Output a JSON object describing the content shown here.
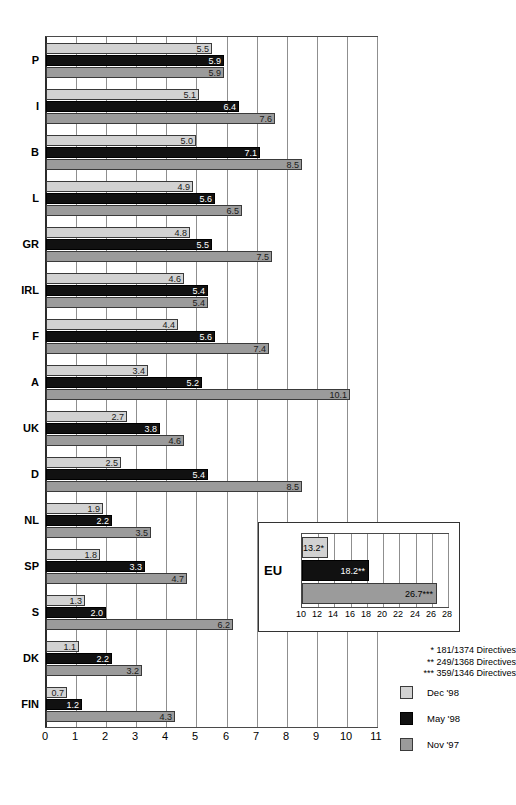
{
  "chart_data": {
    "type": "bar",
    "orientation": "horizontal",
    "title": "",
    "xlabel": "",
    "ylabel": "",
    "xlim": [
      0,
      11
    ],
    "xticks": [
      "0",
      "1",
      "2",
      "3",
      "4",
      "5",
      "6",
      "7",
      "8",
      "9",
      "10",
      "11"
    ],
    "grid": true,
    "legend_position": "bottom-right",
    "categories": [
      "P",
      "I",
      "B",
      "L",
      "GR",
      "IRL",
      "F",
      "A",
      "UK",
      "D",
      "NL",
      "SP",
      "S",
      "DK",
      "FIN"
    ],
    "series": [
      {
        "name": "Dec '98",
        "color": "#d2d2d2",
        "values": [
          5.5,
          5.1,
          5.0,
          4.9,
          4.8,
          4.6,
          4.4,
          3.4,
          2.7,
          2.5,
          1.9,
          1.8,
          1.3,
          1.1,
          0.7
        ],
        "labels": [
          "5.5",
          "5.1",
          "5.0",
          "4.9",
          "4.8",
          "4.6",
          "4.4",
          "3.4",
          "2.7",
          "2.5",
          "1.9",
          "1.8",
          "1.3",
          "1.1",
          "0.7"
        ]
      },
      {
        "name": "May '98",
        "color": "#111111",
        "values": [
          5.9,
          6.4,
          7.1,
          5.6,
          5.5,
          5.4,
          5.6,
          5.2,
          3.8,
          5.4,
          2.2,
          3.3,
          2.0,
          2.2,
          1.2
        ],
        "labels": [
          "5.9",
          "6.4",
          "7.1",
          "5.6",
          "5.5",
          "5.4",
          "5.6",
          "5.2",
          "3.8",
          "5.4",
          "2.2",
          "3.3",
          "2.0",
          "2.2",
          "1.2"
        ]
      },
      {
        "name": "Nov '97",
        "color": "#9b9b9b",
        "values": [
          5.9,
          7.6,
          8.5,
          6.5,
          7.5,
          5.4,
          7.4,
          10.1,
          4.6,
          8.5,
          3.5,
          4.7,
          6.2,
          3.2,
          4.3
        ],
        "labels": [
          "5.9",
          "7.6",
          "8.5",
          "6.5",
          "7.5",
          "5.4",
          "7.4",
          "10.1",
          "4.6",
          "8.5",
          "3.5",
          "4.7",
          "6.2",
          "3.2",
          "4.3"
        ]
      }
    ],
    "inset": {
      "category": "EU",
      "xlim": [
        10,
        28
      ],
      "xticks": [
        "10",
        "12",
        "14",
        "16",
        "18",
        "20",
        "22",
        "24",
        "26",
        "28"
      ],
      "series": [
        {
          "name": "Dec '98",
          "value": 13.2,
          "label": "13.2*"
        },
        {
          "name": "May '98",
          "value": 18.2,
          "label": "18.2**"
        },
        {
          "name": "Nov '97",
          "value": 26.7,
          "label": "26.7***"
        }
      ]
    },
    "footnotes": [
      "* 181/1374 Directives",
      "** 249/1368 Directives",
      "*** 359/1346 Directives"
    ]
  }
}
